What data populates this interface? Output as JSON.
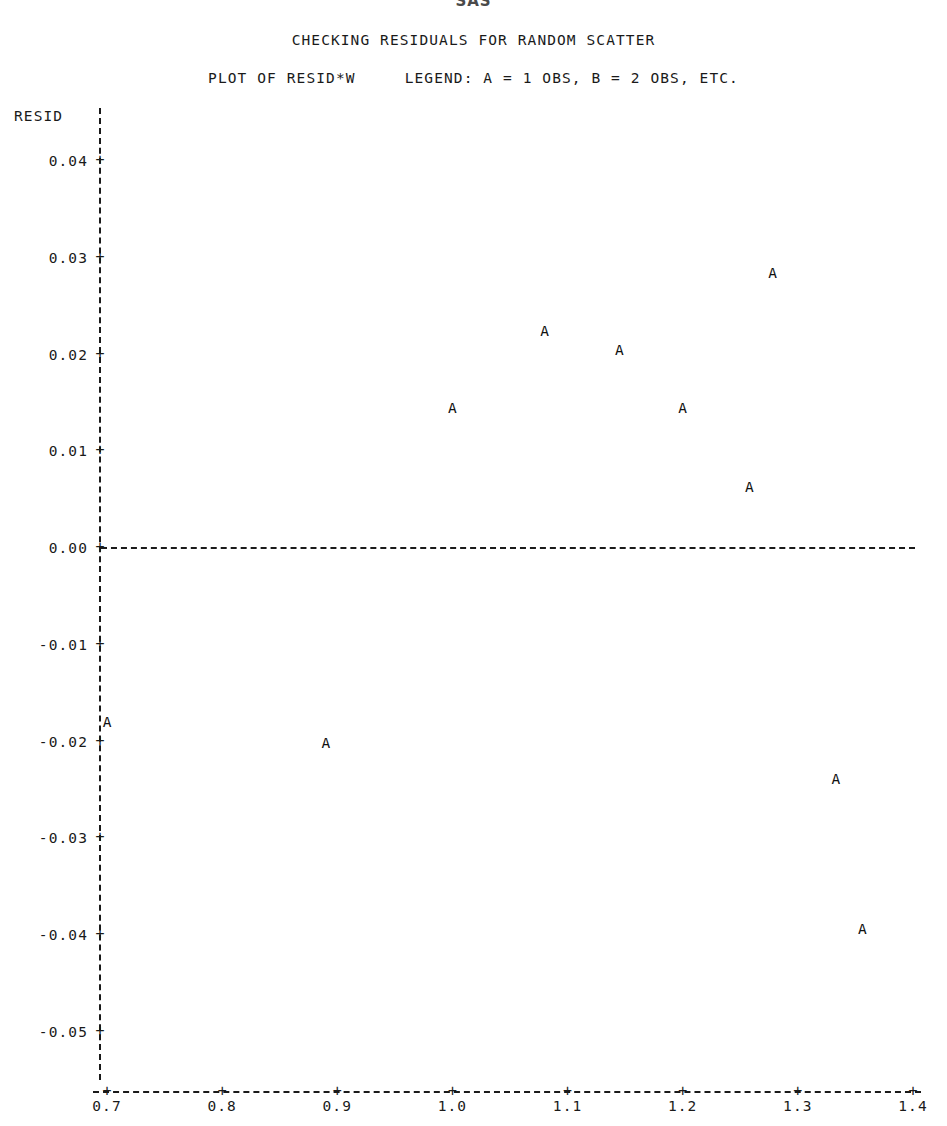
{
  "header": {
    "system_banner": "SAS",
    "title": "CHECKING RESIDUALS FOR RANDOM SCATTER",
    "subtitle": "PLOT OF RESID*W     LEGEND: A = 1 OBS, B = 2 OBS, ETC."
  },
  "axes": {
    "y_name": "RESID",
    "y_ticks": [
      "0.04",
      "0.03",
      "0.02",
      "0.01",
      "0.00",
      "-0.01",
      "-0.02",
      "-0.03",
      "-0.04",
      "-0.05"
    ],
    "x_ticks": [
      "0.7",
      "0.8",
      "0.9",
      "1.0",
      "1.1",
      "1.2",
      "1.3",
      "1.4"
    ],
    "tick_glyph": "+",
    "x_name": ""
  },
  "legend": {
    "entries": [
      {
        "symbol": "A",
        "meaning": "1 OBS"
      },
      {
        "symbol": "B",
        "meaning": "2 OBS"
      }
    ],
    "suffix": "ETC."
  },
  "chart_data": {
    "type": "scatter",
    "title": "CHECKING RESIDUALS FOR RANDOM SCATTER",
    "subtitle": "PLOT OF RESID*W     LEGEND: A = 1 OBS, B = 2 OBS, ETC.",
    "xlabel": "W",
    "ylabel": "RESID",
    "xlim": [
      0.7,
      1.4
    ],
    "ylim": [
      -0.055,
      0.045
    ],
    "grid": false,
    "legend_position": "subtitle",
    "reference_line_y": 0.0,
    "marker_symbol": "A",
    "series": [
      {
        "name": "RESID vs W",
        "marker": "A",
        "points": [
          {
            "label": "A",
            "x": 0.7,
            "y": -0.018
          },
          {
            "label": "A",
            "x": 0.89,
            "y": -0.0202
          },
          {
            "label": "A",
            "x": 1.0,
            "y": 0.0145
          },
          {
            "label": "A",
            "x": 1.08,
            "y": 0.0224
          },
          {
            "label": "A",
            "x": 1.145,
            "y": 0.0205
          },
          {
            "label": "A",
            "x": 1.2,
            "y": 0.0145
          },
          {
            "label": "A",
            "x": 1.258,
            "y": 0.0063
          },
          {
            "label": "A",
            "x": 1.278,
            "y": 0.0284
          },
          {
            "label": "A",
            "x": 1.333,
            "y": -0.0239
          },
          {
            "label": "A",
            "x": 1.356,
            "y": -0.0394
          }
        ]
      }
    ]
  }
}
